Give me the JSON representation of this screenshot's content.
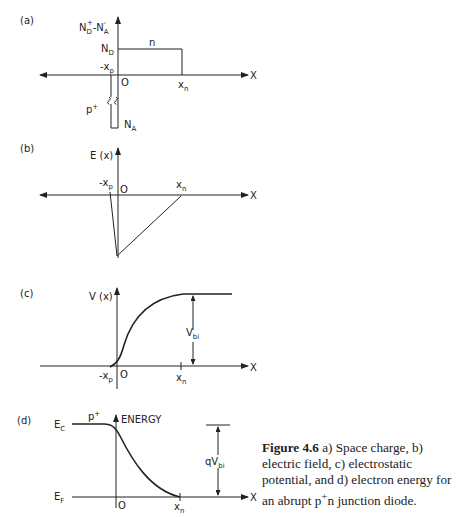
{
  "panels": {
    "a": {
      "tag": "(a)",
      "y_axis": "N_D^+ - N_A^-",
      "y_main": "N",
      "y_sub1": "D",
      "y_sup1": "+",
      "y_minus": "-N",
      "y_sub2": "A",
      "y_sup2": "-",
      "nd_main": "N",
      "nd_sub": "D",
      "region_n": "n",
      "xp_main": "-x",
      "xp_sub": "p",
      "origin": "O",
      "xn_main": "x",
      "xn_sub": "n",
      "x_axis": "X",
      "pplus_main": "p",
      "pplus_sup": "+",
      "na_main": "N",
      "na_sub": "A"
    },
    "b": {
      "tag": "(b)",
      "y_axis": "E (x)",
      "xp_main": "-x",
      "xp_sub": "p",
      "origin": "O",
      "xn_main": "x",
      "xn_sub": "n",
      "x_axis": "X"
    },
    "c": {
      "tag": "(c)",
      "y_axis": "V (x)",
      "vbi_main": "V",
      "vbi_sub": "bi",
      "xp_main": "-x",
      "xp_sub": "p",
      "origin": "O",
      "xn_main": "x",
      "xn_sub": "n",
      "x_axis": "X"
    },
    "d": {
      "tag": "(d)",
      "y_axis": "ENERGY",
      "ec_main": "E",
      "ec_sub": "C",
      "ef_main": "E",
      "ef_sub": "F",
      "pplus_main": "p",
      "pplus_sup": "+",
      "qvbi_main": "qV",
      "qvbi_sub": "bi",
      "origin": "O",
      "xn_main": "x",
      "xn_sub": "n",
      "x_axis": "X"
    }
  },
  "caption": {
    "label": "Figure 4.6",
    "text": " a) Space charge, b) electric field, c) electrostatic potential, and d) electron energy for an abrupt p",
    "sup": "+",
    "tail": "n junction diode."
  }
}
